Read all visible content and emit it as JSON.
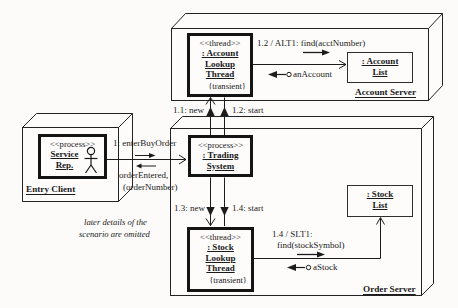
{
  "note": {
    "line1": "later details of the",
    "line2": "scenario are omitted"
  },
  "entry_client": {
    "node_label": "Entry Client",
    "service_rep": {
      "stereotype": "<<process>>",
      "name1": "Service",
      "name2": "Rep."
    }
  },
  "account_server": {
    "node_label": "Account Server",
    "lookup_thread": {
      "stereotype": "<<thread>>",
      "name1": ": Account",
      "name2": "Lookup",
      "name3": "Thread",
      "tag": "{transient}"
    },
    "account_list": {
      "name1": ": Account",
      "name2": "List"
    },
    "msg_find": "1.2 / ALT1: find(acctNumber)",
    "msg_return": "anAccount"
  },
  "order_server": {
    "node_label": "Order Server",
    "trading_system": {
      "stereotype": "<<process>>",
      "name1": ": Trading",
      "name2": "System"
    },
    "stock_thread": {
      "stereotype": "<<thread>>",
      "name1": ": Stock",
      "name2": "Lookup",
      "name3": "Thread",
      "tag": "{transient}"
    },
    "stock_list": {
      "name1": ": Stock",
      "name2": "List"
    },
    "msg_find1": "1.4 / SLT1:",
    "msg_find2": "find(stockSymbol)",
    "msg_return": "aStock"
  },
  "messages": {
    "enter_buy_order": "1: enterBuyOrder",
    "order_entered1": "orderEntered,",
    "order_entered2": "(orderNumber)",
    "new1": "1.1: new",
    "start1": "1.2: start",
    "new2": "1.3: new",
    "start2": "1.4: start"
  }
}
